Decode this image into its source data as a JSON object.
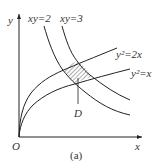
{
  "diagram": {
    "axes": {
      "x_label": "x",
      "y_label": "y",
      "origin_label": "O"
    },
    "curves": [
      {
        "id": "xy2",
        "label": "xy=2"
      },
      {
        "id": "xy3",
        "label": "xy=3"
      },
      {
        "id": "y2_2x",
        "label": "y²=2x"
      },
      {
        "id": "y2_x",
        "label": "y²=x"
      }
    ],
    "region_label": "D",
    "caption": "(a)",
    "colors": {
      "stroke": "#222222",
      "text": "#333333",
      "background": "#ffffff"
    }
  }
}
